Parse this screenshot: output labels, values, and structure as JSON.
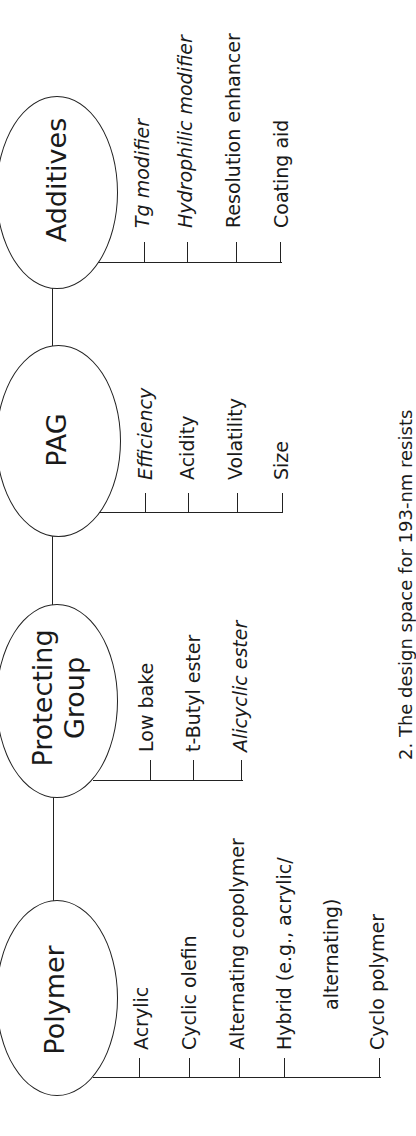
{
  "figure": {
    "title": "Design space for 193-nm resists",
    "caption": "2. The design space for 193-nm resists",
    "orientation": "rotated 90° counter-clockwise",
    "nodes": [
      {
        "id": "polymer",
        "label": "Polymer",
        "items": [
          {
            "text": "Acrylic",
            "italic": false
          },
          {
            "text": "Cyclic olefin",
            "italic": false
          },
          {
            "text": "Alternating copolymer",
            "italic": false
          },
          {
            "text": "Hybrid (e.g., acrylic/",
            "text2": "alternating)",
            "italic": false
          },
          {
            "text": "Cyclo polymer",
            "italic": false
          }
        ]
      },
      {
        "id": "protecting-group",
        "label": "Protecting",
        "label2": "Group",
        "items": [
          {
            "text": "Low bake",
            "italic": false
          },
          {
            "text": "t-Butyl ester",
            "italic": false
          },
          {
            "text": "Alicyclic ester",
            "italic": true
          }
        ]
      },
      {
        "id": "pag",
        "label": "PAG",
        "items": [
          {
            "text": "Efficiency",
            "italic": true
          },
          {
            "text": "Acidity",
            "italic": false
          },
          {
            "text": "Volatility",
            "italic": false
          },
          {
            "text": "Size",
            "italic": false
          }
        ]
      },
      {
        "id": "additives",
        "label": "Additives",
        "items": [
          {
            "text": "Tg modifier",
            "italic": true
          },
          {
            "text": "Hydrophilic modifier",
            "italic": true
          },
          {
            "text": "Resolution enhancer",
            "italic": false
          },
          {
            "text": "Coating aid",
            "italic": false
          }
        ]
      }
    ],
    "colors": {
      "line": "#222222",
      "text": "#1a1a1a",
      "background": "#ffffff"
    }
  }
}
